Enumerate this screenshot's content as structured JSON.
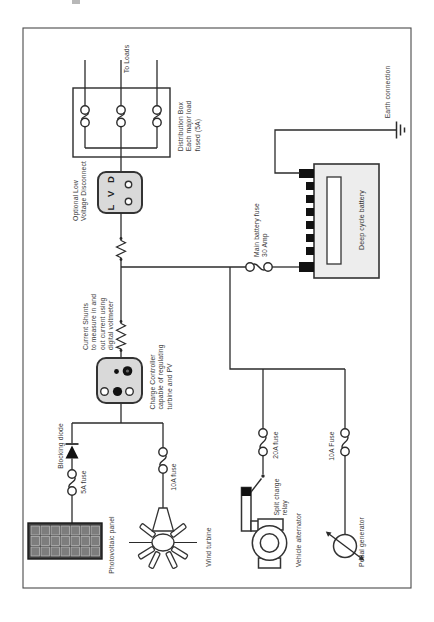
{
  "palette": {
    "line": "#2b2b2b",
    "box_fill": "#d9d9d9",
    "battery_fill": "#ededed",
    "panel_frame": "#3f3f3f",
    "panel_cell": "#7d7d7d",
    "terminal": "#111111"
  },
  "labels": {
    "to_loads": "To Loads",
    "distribution_box": {
      "l1": "Distribution Box",
      "l2": "Each major load",
      "l3": "fused (5A)"
    },
    "lvd": {
      "l1": "Optional Low",
      "l2": "Voltage Disconnect"
    },
    "lvd_box_text": "L V D",
    "current_shunts": {
      "l1": "Current Shunts",
      "l2": "to measure in and",
      "l3": "out current using",
      "l4": "digital voltmeter"
    },
    "charge_controller": {
      "l1": "Charge Controller",
      "l2": "capable of regulating",
      "l3": "turbine and PV"
    },
    "main_battery_fuse": {
      "l1": "Main battery fuse",
      "l2": "30 Amp"
    },
    "deep_cycle_battery": "Deep cycle battery",
    "earth_connection": "Earth connection",
    "blocking_diode": "Blocking diode",
    "fuse_5a": "5A fuse",
    "photovoltaic_panel": "Photovoltaic panel",
    "fuse_10a_wind": "10A fuse",
    "wind_turbine": "Wind turbine",
    "fuse_20a": "20A fuse",
    "split_charge_relay": {
      "l1": "Split charge",
      "l2": "relay"
    },
    "vehicle_alternator": "Vehicle alternator",
    "fuse_10a_pedal": "10A Fuse",
    "pedal_generator": "Pedal generator"
  }
}
